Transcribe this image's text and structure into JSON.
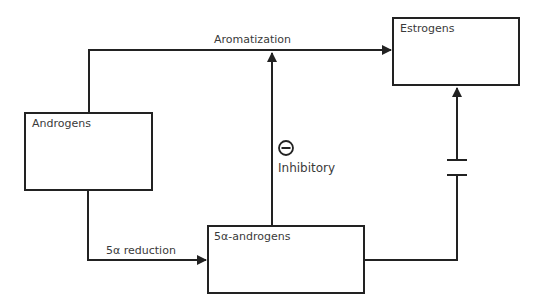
{
  "diagram": {
    "nodes": [
      {
        "id": "androgens",
        "label": "Androgens"
      },
      {
        "id": "estrogens",
        "label": "Estrogens"
      },
      {
        "id": "5a_androgens",
        "label": "5α-androgens"
      }
    ],
    "edges": [
      {
        "from": "androgens",
        "to": "estrogens",
        "label": "Aromatization"
      },
      {
        "from": "androgens",
        "to": "5a_androgens",
        "label": "5α reduction"
      },
      {
        "from": "5a_androgens",
        "to": "aromatization",
        "label": "Inhibitory",
        "symbol": "minus-circle"
      },
      {
        "from": "5a_androgens",
        "to": "estrogens",
        "label": "",
        "symbol": "broken-line"
      }
    ],
    "colors": {
      "line": "#222222",
      "text": "#3a3a3a"
    }
  }
}
